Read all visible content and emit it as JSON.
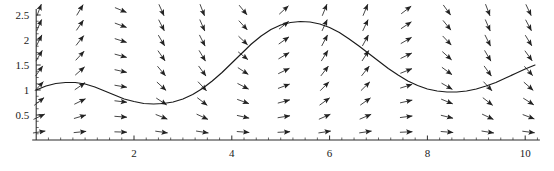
{
  "chart_data": {
    "type": "line",
    "title": "",
    "subtitle": "",
    "xlabel": "",
    "ylabel": "",
    "grid": false,
    "legend": null,
    "legend_position": "none",
    "plot_style": "slope-field-with-solution-curve",
    "xlim": [
      0,
      10.3
    ],
    "ylim": [
      0,
      2.62
    ],
    "xticks_major": [
      2,
      4,
      6,
      8,
      10
    ],
    "xtick_labels": [
      "2",
      "4",
      "6",
      "8",
      "10"
    ],
    "yticks_major": [
      0.5,
      1,
      1.5,
      2,
      2.5
    ],
    "ytick_labels": [
      "0.5",
      "1",
      "1.5",
      "2",
      "2.5"
    ],
    "xticks_minor_step": 0.25,
    "yticks_minor_step": 0.125,
    "axis_color": "#2b2b2b",
    "curve_color": "#1a1a1a",
    "arrow_color": "#222222",
    "background_color": "#ffffff",
    "series": [
      {
        "name": "solution curve",
        "type": "line",
        "x": [
          0.0,
          0.2,
          0.4,
          0.6,
          0.8,
          1.0,
          1.2,
          1.4,
          1.6,
          1.8,
          2.0,
          2.2,
          2.4,
          2.6,
          2.8,
          3.0,
          3.2,
          3.4,
          3.6,
          3.8,
          4.0,
          4.2,
          4.4,
          4.6,
          4.8,
          5.0,
          5.2,
          5.4,
          5.6,
          5.8,
          6.0,
          6.2,
          6.4,
          6.6,
          6.8,
          7.0,
          7.2,
          7.4,
          7.6,
          7.8,
          8.0,
          8.2,
          8.4,
          8.6,
          8.8,
          9.0,
          9.2,
          9.4,
          9.6,
          9.8,
          10.0,
          10.2
        ],
        "y": [
          1.0,
          1.08,
          1.13,
          1.15,
          1.15,
          1.12,
          1.06,
          0.98,
          0.9,
          0.82,
          0.77,
          0.73,
          0.72,
          0.73,
          0.76,
          0.82,
          0.91,
          1.03,
          1.18,
          1.35,
          1.54,
          1.73,
          1.92,
          2.08,
          2.21,
          2.3,
          2.35,
          2.37,
          2.36,
          2.32,
          2.25,
          2.15,
          2.02,
          1.88,
          1.73,
          1.58,
          1.43,
          1.3,
          1.18,
          1.09,
          1.02,
          0.98,
          0.96,
          0.96,
          0.98,
          1.02,
          1.08,
          1.15,
          1.24,
          1.33,
          1.42,
          1.5
        ]
      }
    ],
    "vector_field": {
      "description": "direction field arrows on a regular grid",
      "ncols": 13,
      "nrows": 9,
      "x_start": 0.06,
      "x_step": 0.834,
      "y_start": 0.16,
      "y_step": 0.305,
      "slope_function": "y' = y*cos(x)"
    }
  },
  "axes": {
    "x_axis_name": "horizontal-axis",
    "y_axis_name": "vertical-axis"
  }
}
